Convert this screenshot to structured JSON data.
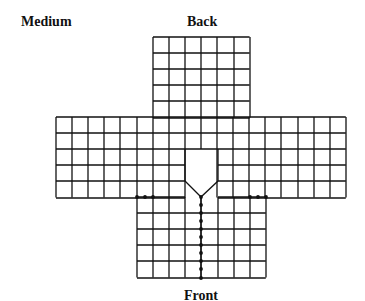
{
  "labels": {
    "size": "Medium",
    "top": "Back",
    "bottom": "Front"
  },
  "style": {
    "line_color": "#111111",
    "background": "#ffffff"
  },
  "grid": {
    "cell": 16.1,
    "back_panel": {
      "x": 153,
      "y": 37,
      "cols": 6,
      "rows": 5
    },
    "middle_band": {
      "x": 56,
      "y": 117,
      "cols": 18,
      "rows": 5
    },
    "front_panel": {
      "x": 137,
      "y": 197,
      "cols": 8,
      "rows": 5
    },
    "neck_notch": {
      "left_x": 185,
      "right_x": 218,
      "top_y": 149,
      "shoulder_y": 181,
      "point": [
        201,
        197
      ]
    }
  },
  "dots": {
    "left_seam": [
      [
        137,
        197
      ],
      [
        145,
        197
      ],
      [
        153,
        197
      ]
    ],
    "right_seam": [
      [
        250,
        197
      ],
      [
        258,
        197
      ],
      [
        266,
        197
      ]
    ],
    "center_front": {
      "x": 201,
      "y_start": 197,
      "y_end": 278,
      "step": 8.05
    }
  }
}
